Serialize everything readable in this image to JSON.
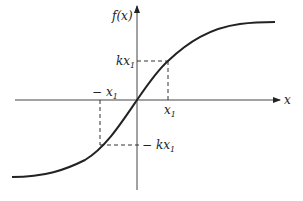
{
  "diagram": {
    "type": "function-plot",
    "axes": {
      "x_label": "x",
      "y_label": "f(x)"
    },
    "markers": {
      "pos_x": {
        "base": "x",
        "sub": "1"
      },
      "neg_x": {
        "prefix": "− ",
        "base": "x",
        "sub": "1"
      },
      "pos_y": {
        "base": "kx",
        "sub": "1"
      },
      "neg_y": {
        "prefix": "− ",
        "base": "kx",
        "sub": "1"
      }
    },
    "colors": {
      "stroke": "#222222",
      "background": "#ffffff"
    }
  }
}
